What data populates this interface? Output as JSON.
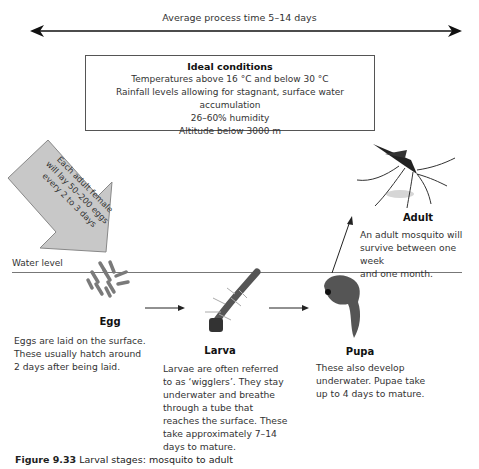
{
  "timeline": {
    "label": "Average process time 5–14 days"
  },
  "conditions": {
    "title": "Ideal conditions",
    "lines": [
      "Temperatures above 16 °C and below 30 °C",
      "Rainfall levels allowing for stagnant, surface water accumulation",
      "26–60% humidity",
      "Altitude below 3000 m"
    ]
  },
  "laying_arrow": {
    "lines": [
      "Each adult female",
      "will lay 50–200 eggs",
      "every 2 to 3 days"
    ],
    "fill": "#c8c8c8"
  },
  "water_level": {
    "label": "Water level"
  },
  "stages": [
    {
      "name": "Egg",
      "lines": [
        "Eggs are laid on the surface.",
        "These usually hatch around",
        "2 days after being laid."
      ]
    },
    {
      "name": "Larva",
      "lines": [
        "Larvae are often referred",
        "to as ‘wigglers’. They stay",
        "underwater and breathe",
        "through a tube that",
        "reaches the surface. These",
        "take approximately 7–14",
        "days to mature."
      ]
    },
    {
      "name": "Pupa",
      "lines": [
        "These also develop",
        "underwater. Pupae take",
        "up to 4 days to mature."
      ]
    },
    {
      "name": "Adult",
      "lines": [
        "An adult mosquito will",
        "survive between one week",
        "and one month."
      ]
    }
  ],
  "caption": {
    "number": "Figure 9.33",
    "text": "Larval stages: mosquito to adult"
  }
}
